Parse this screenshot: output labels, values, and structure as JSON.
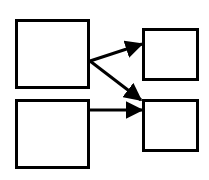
{
  "diagram": {
    "background": "#ffffff",
    "stroke_color": "#000000",
    "nodes": [
      {
        "id": "node-a",
        "x": 15,
        "y": 19,
        "w": 75,
        "h": 70
      },
      {
        "id": "node-b",
        "x": 15,
        "y": 99,
        "w": 75,
        "h": 70
      },
      {
        "id": "node-c",
        "x": 142,
        "y": 28,
        "w": 57,
        "h": 53
      },
      {
        "id": "node-d",
        "x": 142,
        "y": 99,
        "w": 57,
        "h": 53
      }
    ],
    "edges": [
      {
        "from": "node-a",
        "to": "node-c",
        "x1": 90,
        "y1": 61,
        "x2": 142,
        "y2": 44
      },
      {
        "from": "node-a",
        "to": "node-d",
        "x1": 90,
        "y1": 61,
        "x2": 141,
        "y2": 100
      },
      {
        "from": "node-b",
        "to": "node-d",
        "x1": 90,
        "y1": 110,
        "x2": 142,
        "y2": 110
      }
    ]
  }
}
